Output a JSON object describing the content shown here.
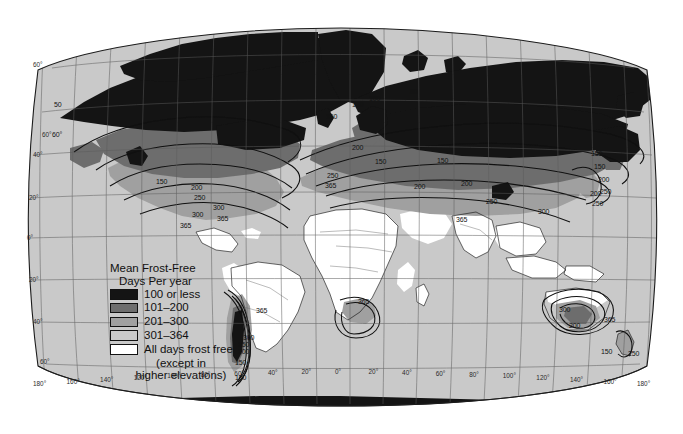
{
  "figure": {
    "kind": "thematic-world-map",
    "projection": "Robinson-like oval world projection",
    "background_color": "#ffffff",
    "ocean_color": "#c9c9c9",
    "graticule_color": "#555555",
    "coastline_color": "#141414",
    "contour_color": "#111111"
  },
  "legend": {
    "title_line1": "Mean Frost-Free",
    "title_line2": "Days Per year",
    "entries": [
      {
        "label": "100 or less",
        "color": "#141414"
      },
      {
        "label": "101–200",
        "color": "#6e6e6e"
      },
      {
        "label": "201–300",
        "color": "#a0a0a0"
      },
      {
        "label": "301–364",
        "color": "#c9c9c9"
      }
    ],
    "frost_free_line1": "All days frost free",
    "frost_free_line2": "(except in",
    "frost_free_line3": "higher elevations)",
    "frost_free_color": "#ffffff"
  },
  "graticule": {
    "longitude_labels": [
      "180°",
      "160°",
      "140°",
      "120°",
      "100°",
      "80°",
      "60°",
      "40°",
      "20°",
      "0°",
      "20°",
      "40°",
      "60°",
      "80°",
      "100°",
      "120°",
      "140°",
      "160°",
      "180°"
    ],
    "latitude_labels_left": [
      "60°",
      "60°",
      "40°",
      "20°",
      "0°",
      "20°",
      "40°",
      "60°"
    ],
    "latitude_spacing_degrees": 20,
    "longitude_spacing_degrees": 20
  },
  "contour_labels": [
    {
      "value": "50",
      "x": 54,
      "y": 101
    },
    {
      "value": "60°",
      "x": 52,
      "y": 131
    },
    {
      "value": "50",
      "x": 410,
      "y": 88
    },
    {
      "value": "100",
      "x": 369,
      "y": 95
    },
    {
      "value": "150",
      "x": 352,
      "y": 101
    },
    {
      "value": "150",
      "x": 326,
      "y": 113
    },
    {
      "value": "150",
      "x": 156,
      "y": 178
    },
    {
      "value": "200",
      "x": 191,
      "y": 184
    },
    {
      "value": "250",
      "x": 194,
      "y": 194
    },
    {
      "value": "300",
      "x": 213,
      "y": 204
    },
    {
      "value": "300",
      "x": 192,
      "y": 211
    },
    {
      "value": "365",
      "x": 217,
      "y": 215
    },
    {
      "value": "365",
      "x": 180,
      "y": 222
    },
    {
      "value": "200",
      "x": 352,
      "y": 144
    },
    {
      "value": "150",
      "x": 375,
      "y": 158
    },
    {
      "value": "150",
      "x": 437,
      "y": 157
    },
    {
      "value": "250",
      "x": 327,
      "y": 172
    },
    {
      "value": "365",
      "x": 325,
      "y": 182
    },
    {
      "value": "200",
      "x": 414,
      "y": 183
    },
    {
      "value": "200",
      "x": 461,
      "y": 180
    },
    {
      "value": "250",
      "x": 486,
      "y": 198
    },
    {
      "value": "365",
      "x": 456,
      "y": 216
    },
    {
      "value": "150",
      "x": 594,
      "y": 163
    },
    {
      "value": "200",
      "x": 598,
      "y": 176
    },
    {
      "value": "250",
      "x": 600,
      "y": 188
    },
    {
      "value": "150",
      "x": 591,
      "y": 150
    },
    {
      "value": "200",
      "x": 590,
      "y": 190
    },
    {
      "value": "250",
      "x": 592,
      "y": 200
    },
    {
      "value": "300",
      "x": 538,
      "y": 208
    },
    {
      "value": "365",
      "x": 256,
      "y": 307
    },
    {
      "value": "300",
      "x": 243,
      "y": 334
    },
    {
      "value": "250",
      "x": 238,
      "y": 341
    },
    {
      "value": "200",
      "x": 238,
      "y": 348
    },
    {
      "value": "150",
      "x": 235,
      "y": 359
    },
    {
      "value": "100",
      "x": 235,
      "y": 374
    },
    {
      "value": "365",
      "x": 358,
      "y": 298
    },
    {
      "value": "300",
      "x": 559,
      "y": 306
    },
    {
      "value": "200",
      "x": 569,
      "y": 322
    },
    {
      "value": "365",
      "x": 604,
      "y": 316
    },
    {
      "value": "150",
      "x": 601,
      "y": 348
    },
    {
      "value": "250",
      "x": 628,
      "y": 350
    }
  ]
}
